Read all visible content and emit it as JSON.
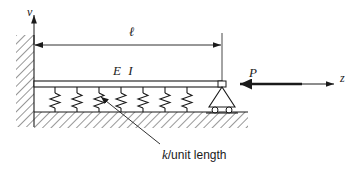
{
  "figure": {
    "type": "engineering-diagram",
    "background_color": "#ffffff",
    "line_color": "#1a1a1a",
    "labels": {
      "v_axis": "v",
      "z_axis": "z",
      "length_dimension": "ℓ",
      "beam_stiffness": "E I",
      "axial_load": "P",
      "foundation_modulus_italic": "k",
      "foundation_modulus_rest": "/unit length",
      "foundation_modulus_full": "k/unit length"
    },
    "elements": {
      "wall": {
        "name": "fixed-wall",
        "hatching": "diagonal-45",
        "x": 16,
        "y": 35,
        "width": 18,
        "height": 92
      },
      "beam": {
        "name": "beam",
        "x1": 34,
        "x2": 222,
        "y": 84,
        "thickness": 6,
        "label": "E I"
      },
      "ground": {
        "name": "ground-hatching",
        "x": 34,
        "y": 112,
        "width": 214,
        "height": 16,
        "hatching": "diagonal-45"
      },
      "springs": {
        "name": "foundation-springs",
        "count": 7,
        "x_positions": [
          55,
          77,
          99,
          121,
          143,
          165,
          187
        ],
        "top_y": 90,
        "bottom_y": 112
      },
      "support": {
        "name": "roller-support",
        "type": "roller",
        "x": 222,
        "y": 90,
        "rollers": 2
      },
      "load_arrow": {
        "name": "axial-load-arrow",
        "direction": "left",
        "from_x": 302,
        "to_x": 230,
        "y": 84
      },
      "dimension_line": {
        "name": "length-dimension-line",
        "from_x": 34,
        "to_x": 222,
        "y": 45
      },
      "v_axis_arrow": {
        "name": "v-axis-arrow",
        "direction": "up",
        "x": 34,
        "from_y": 45,
        "to_y": 13
      },
      "z_axis_arrow": {
        "name": "z-axis-arrow",
        "direction": "right",
        "from_x": 300,
        "to_x": 336,
        "y": 84
      },
      "leader": {
        "name": "caption-leader-line",
        "from_x": 160,
        "from_y": 145,
        "to_x": 100,
        "to_y": 97
      }
    }
  }
}
